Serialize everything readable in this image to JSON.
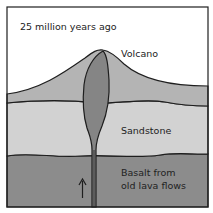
{
  "diagram": {
    "title": "25 million years ago",
    "labels": {
      "volcano": "Volcano",
      "sandstone": "Sandstone",
      "basalt_line1": "Basalt from",
      "basalt_line2": "old lava flows"
    },
    "arrow": "upward-arrow",
    "colors": {
      "sky": "#ffffff",
      "volcano_cone": "#b4b4b4",
      "sandstone": "#d2d2d2",
      "basalt": "#8c8c8c",
      "magma": "#858585",
      "outline": "#1e1e1e"
    }
  }
}
